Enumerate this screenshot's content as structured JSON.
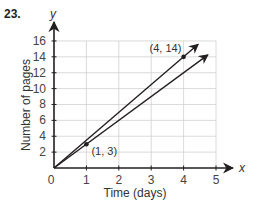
{
  "problem_number": "23.",
  "chart_data": {
    "type": "line",
    "title": "",
    "xlabel": "Time (days)",
    "ylabel": "Number of pages",
    "x_axis_letter": "x",
    "y_axis_letter": "y",
    "xlim": [
      0,
      5
    ],
    "ylim": [
      0,
      16
    ],
    "x_ticks": [
      0,
      1,
      2,
      3,
      4,
      5
    ],
    "y_ticks": [
      2,
      4,
      6,
      8,
      10,
      12,
      14,
      16
    ],
    "grid": true,
    "series": [
      {
        "name": "upper line",
        "slope": 3.5,
        "x": [
          0,
          4
        ],
        "y": [
          0,
          14
        ],
        "labeled_point": {
          "x": 4,
          "y": 14,
          "label": "(4, 14)"
        }
      },
      {
        "name": "lower line",
        "slope": 3,
        "x": [
          0,
          1
        ],
        "y": [
          0,
          3
        ],
        "labeled_point": {
          "x": 1,
          "y": 3,
          "label": "(1, 3)"
        }
      }
    ],
    "origin_label": "0"
  },
  "colors": {
    "axis": "#231f20",
    "grid": "#d0d0d0",
    "line": "#231f20"
  }
}
